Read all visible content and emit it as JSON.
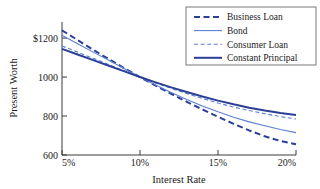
{
  "chart_data": {
    "type": "line",
    "title": "",
    "xlabel": "Interest Rate",
    "ylabel": "Present Worth",
    "xlim": [
      5,
      20
    ],
    "ylim": [
      600,
      1200
    ],
    "grid": false,
    "legend_position": "top-right",
    "x_tick_labels": [
      "5%",
      "10%",
      "15%",
      "20%"
    ],
    "x_ticks": [
      5,
      10,
      15,
      20
    ],
    "y_tick_labels": [
      "$1200",
      "1000",
      "800",
      "600"
    ],
    "y_ticks": [
      1200,
      1000,
      800,
      600
    ],
    "x": [
      5,
      6,
      7,
      8,
      9,
      10,
      11,
      12,
      13,
      14,
      15,
      16,
      17,
      18,
      19,
      20
    ],
    "series": [
      {
        "name": "Business Loan",
        "style": "dashed",
        "width": 2.0,
        "color": "#2b3f96",
        "values": [
          1240,
          1190,
          1140,
          1092,
          1045,
          1000,
          956,
          914,
          873,
          834,
          796,
          760,
          726,
          696,
          672,
          655
        ]
      },
      {
        "name": "Bond",
        "style": "solid",
        "width": 1.1,
        "color": "#5b7fd4",
        "values": [
          1215,
          1171,
          1128,
          1086,
          1043,
          1000,
          959,
          921,
          885,
          852,
          822,
          794,
          770,
          750,
          731,
          715
        ]
      },
      {
        "name": "Consumer Loan",
        "style": "dashed",
        "width": 1.1,
        "color": "#5b7fd4",
        "values": [
          1160,
          1128,
          1096,
          1064,
          1032,
          1000,
          970,
          942,
          915,
          890,
          867,
          846,
          828,
          812,
          797,
          785
        ]
      },
      {
        "name": "Constant Principal",
        "style": "solid",
        "width": 2.0,
        "color": "#2b3f96",
        "values": [
          1145,
          1116,
          1087,
          1058,
          1029,
          1000,
          973,
          947,
          923,
          900,
          879,
          860,
          843,
          828,
          815,
          805
        ]
      }
    ]
  },
  "legend": {
    "items": [
      {
        "label": "Business Loan"
      },
      {
        "label": "Bond"
      },
      {
        "label": "Consumer Loan"
      },
      {
        "label": "Constant Principal"
      }
    ]
  },
  "colors": {
    "dark_blue": "#2b3f96",
    "light_blue": "#5b7fd4",
    "axis": "#3a3a3a",
    "text": "#1a1a1a",
    "background": "#ffffff"
  }
}
